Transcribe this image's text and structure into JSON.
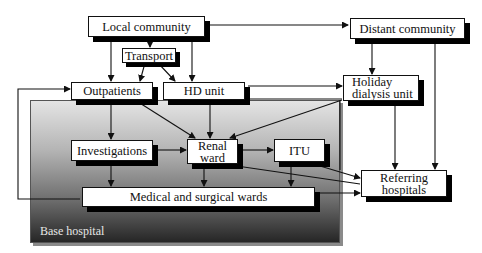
{
  "diagram": {
    "region": {
      "label": "Base hospital"
    },
    "nodes": {
      "local_community": "Local community",
      "transport": "Transport",
      "distant_community": "Distant community",
      "outpatients": "Outpatients",
      "hd_unit": "HD unit",
      "holiday_dialysis_unit": "Holiday dialysis unit",
      "investigations": "Investigations",
      "renal_ward": "Renal ward",
      "itu": "ITU",
      "medical_surgical_wards": "Medical and surgical wards",
      "referring_hospitals": "Referring hospitals"
    },
    "edges": [
      {
        "from": "Local community",
        "to": "Distant community",
        "bidirectional": true
      },
      {
        "from": "Local community",
        "to": "Transport"
      },
      {
        "from": "Local community",
        "to": "Outpatients"
      },
      {
        "from": "Local community",
        "to": "HD unit"
      },
      {
        "from": "Transport",
        "to": "Outpatients"
      },
      {
        "from": "Transport",
        "to": "HD unit"
      },
      {
        "from": "Distant community",
        "to": "Holiday dialysis unit"
      },
      {
        "from": "Distant community",
        "to": "Referring hospitals"
      },
      {
        "from": "HD unit",
        "to": "Holiday dialysis unit",
        "bidirectional": true
      },
      {
        "from": "Holiday dialysis unit",
        "to": "Renal ward"
      },
      {
        "from": "Holiday dialysis unit",
        "to": "Referring hospitals"
      },
      {
        "from": "Outpatients",
        "to": "Investigations",
        "bidirectional": true
      },
      {
        "from": "Outpatients",
        "to": "Renal ward"
      },
      {
        "from": "HD unit",
        "to": "Renal ward",
        "bidirectional": true
      },
      {
        "from": "Investigations",
        "to": "Renal ward"
      },
      {
        "from": "Investigations",
        "to": "Medical and surgical wards",
        "bidirectional": true
      },
      {
        "from": "Renal ward",
        "to": "ITU",
        "bidirectional": true
      },
      {
        "from": "Renal ward",
        "to": "Medical and surgical wards",
        "bidirectional": true
      },
      {
        "from": "ITU",
        "to": "Medical and surgical wards",
        "bidirectional": true
      },
      {
        "from": "ITU",
        "to": "Referring hospitals"
      },
      {
        "from": "Renal ward",
        "to": "Referring hospitals"
      },
      {
        "from": "Medical and surgical wards",
        "to": "Referring hospitals"
      },
      {
        "from": "Medical and surgical wards",
        "to": "Outpatients",
        "loop": "left"
      }
    ]
  }
}
